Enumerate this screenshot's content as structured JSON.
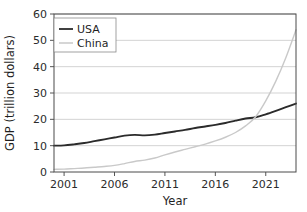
{
  "chart_data": {
    "type": "line",
    "title": "",
    "xlabel": "Year",
    "ylabel": "GDP (trillion dollars)",
    "xlim": [
      2000,
      2024
    ],
    "ylim": [
      0,
      60
    ],
    "xticks": [
      2001,
      2006,
      2011,
      2016,
      2021
    ],
    "xtick_labels": [
      "2001",
      "2006",
      "2011",
      "2016",
      "2021"
    ],
    "yticks": [
      0,
      10,
      20,
      30,
      40,
      50,
      60
    ],
    "ytick_labels": [
      "0",
      "10",
      "20",
      "30",
      "40",
      "50",
      "60"
    ],
    "grid": "horizontal",
    "legend_position": "upper-left",
    "x": [
      2000,
      2001,
      2002,
      2003,
      2004,
      2005,
      2006,
      2007,
      2008,
      2009,
      2010,
      2011,
      2012,
      2013,
      2014,
      2015,
      2016,
      2017,
      2018,
      2019,
      2020,
      2021,
      2022,
      2023,
      2024
    ],
    "series": [
      {
        "name": "USA",
        "color": "#2b2b2b",
        "values": [
          10.0,
          10.1,
          10.5,
          11.0,
          11.7,
          12.4,
          13.1,
          13.8,
          14.1,
          13.9,
          14.2,
          14.8,
          15.4,
          16.0,
          16.7,
          17.3,
          17.9,
          18.6,
          19.5,
          20.3,
          20.8,
          21.9,
          23.2,
          24.6,
          26.0
        ]
      },
      {
        "name": "China",
        "color": "#c9c9c9",
        "values": [
          1.0,
          1.1,
          1.3,
          1.5,
          1.8,
          2.1,
          2.5,
          3.2,
          4.0,
          4.5,
          5.3,
          6.5,
          7.6,
          8.6,
          9.6,
          10.6,
          11.8,
          13.2,
          15.0,
          17.5,
          21.0,
          27.0,
          34.5,
          43.5,
          54.0
        ]
      }
    ]
  },
  "legend": {
    "entries": [
      {
        "label": "USA",
        "swatch": "line-swatch-dark"
      },
      {
        "label": "China",
        "swatch": "line-swatch-light"
      }
    ]
  },
  "axes": {
    "x_title": "Year",
    "y_title": "GDP (trillion dollars)"
  }
}
